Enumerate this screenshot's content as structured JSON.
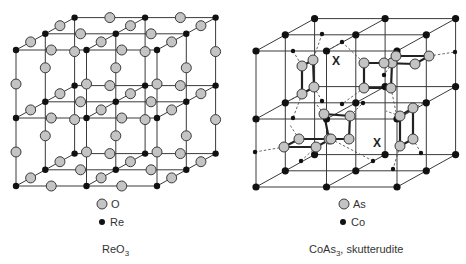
{
  "panels": [
    {
      "id": "reo3",
      "caption": "ReO",
      "caption_subscript": "3",
      "caption_suffix": "",
      "legend": [
        {
          "symbol": "large-gray-atom",
          "label": "O"
        },
        {
          "symbol": "small-black-atom",
          "label": "Re"
        }
      ],
      "lattice": "3x3x3 grid of Re atoms at cube corners with O atoms at every edge midpoint"
    },
    {
      "id": "coas3",
      "caption": "CoAs",
      "caption_subscript": "3",
      "caption_suffix": ", skutterudite",
      "legend": [
        {
          "symbol": "large-gray-atom",
          "label": "As"
        },
        {
          "symbol": "small-black-atom",
          "label": "Co"
        }
      ],
      "vacancy_marker": "X",
      "vacancy_count": 2,
      "as4_ring_count": 6
    }
  ]
}
